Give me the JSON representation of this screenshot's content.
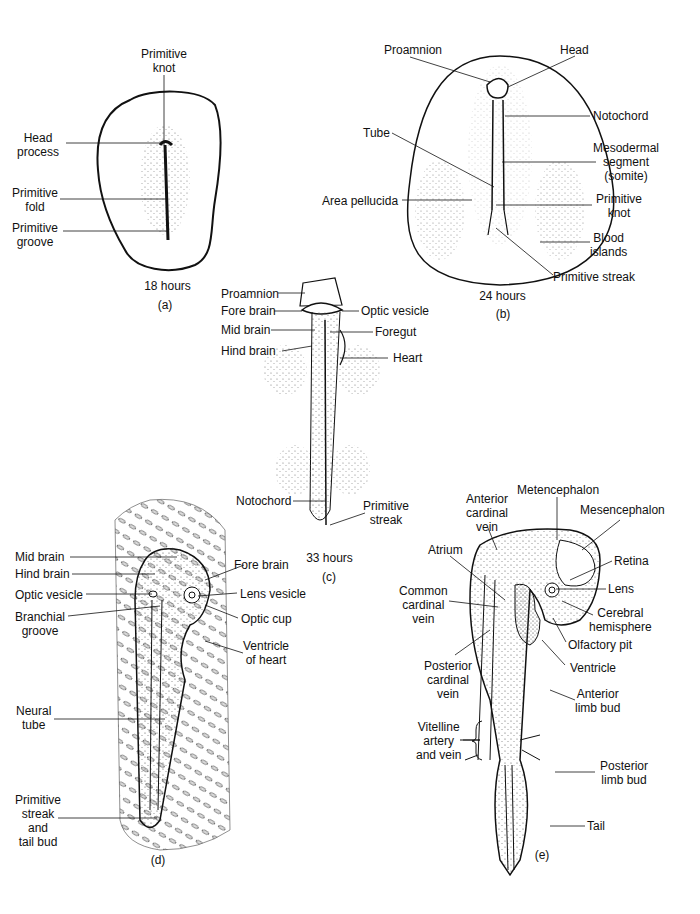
{
  "figure": {
    "panels": [
      {
        "id": "a",
        "caption": "(a)",
        "stage": "18 hours",
        "labels": [
          {
            "text": "Primitive knot",
            "lines": [
              "Primitive",
              "knot"
            ]
          },
          {
            "text": "Head process",
            "lines": [
              "Head",
              "process"
            ]
          },
          {
            "text": "Primitive fold",
            "lines": [
              "Primitive",
              "fold"
            ]
          },
          {
            "text": "Primitive groove",
            "lines": [
              "Primitive",
              "groove"
            ]
          }
        ]
      },
      {
        "id": "b",
        "caption": "(b)",
        "stage": "24 hours",
        "labels": [
          {
            "text": "Proamnion",
            "lines": [
              "Proamnion"
            ]
          },
          {
            "text": "Head",
            "lines": [
              "Head"
            ]
          },
          {
            "text": "Notochord",
            "lines": [
              "Notochord"
            ]
          },
          {
            "text": "Tube",
            "lines": [
              "Tube"
            ]
          },
          {
            "text": "Mesodermal segment (somite)",
            "lines": [
              "Mesodermal",
              "segment",
              "(somite)"
            ]
          },
          {
            "text": "Area pellucida",
            "lines": [
              "Area pellucida"
            ]
          },
          {
            "text": "Primitive knot",
            "lines": [
              "Primitive",
              "knot"
            ]
          },
          {
            "text": "Blood islands",
            "lines": [
              "Blood",
              "islands"
            ]
          },
          {
            "text": "Primitive streak",
            "lines": [
              "Primitive streak"
            ]
          }
        ]
      },
      {
        "id": "c",
        "caption": "(c)",
        "stage": "33 hours",
        "labels": [
          {
            "text": "Proamnion",
            "lines": [
              "Proamnion"
            ]
          },
          {
            "text": "Fore brain",
            "lines": [
              "Fore brain"
            ]
          },
          {
            "text": "Optic vesicle",
            "lines": [
              "Optic vesicle"
            ]
          },
          {
            "text": "Mid brain",
            "lines": [
              "Mid brain"
            ]
          },
          {
            "text": "Foregut",
            "lines": [
              "Foregut"
            ]
          },
          {
            "text": "Hind brain",
            "lines": [
              "Hind brain"
            ]
          },
          {
            "text": "Heart",
            "lines": [
              "Heart"
            ]
          },
          {
            "text": "Notochord",
            "lines": [
              "Notochord"
            ]
          },
          {
            "text": "Primitive streak",
            "lines": [
              "Primitive",
              "streak"
            ]
          }
        ]
      },
      {
        "id": "d",
        "caption": "(d)",
        "labels": [
          {
            "text": "Mid brain",
            "lines": [
              "Mid brain"
            ]
          },
          {
            "text": "Hind brain",
            "lines": [
              "Hind brain"
            ]
          },
          {
            "text": "Fore brain",
            "lines": [
              "Fore brain"
            ]
          },
          {
            "text": "Optic vesicle",
            "lines": [
              "Optic vesicle"
            ]
          },
          {
            "text": "Lens vesicle",
            "lines": [
              "Lens vesicle"
            ]
          },
          {
            "text": "Branchial groove",
            "lines": [
              "Branchial",
              "groove"
            ]
          },
          {
            "text": "Optic cup",
            "lines": [
              "Optic cup"
            ]
          },
          {
            "text": "Ventricle of heart",
            "lines": [
              "Ventricle",
              "of heart"
            ]
          },
          {
            "text": "Neural tube",
            "lines": [
              "Neural",
              "tube"
            ]
          },
          {
            "text": "Primitive streak and tail bud",
            "lines": [
              "Primitive",
              "streak",
              "and",
              "tail bud"
            ]
          }
        ]
      },
      {
        "id": "e",
        "caption": "(e)",
        "labels": [
          {
            "text": "Metencephalon",
            "lines": [
              "Metencephalon"
            ]
          },
          {
            "text": "Anterior cardinal vein",
            "lines": [
              "Anterior",
              "cardinal",
              "vein"
            ]
          },
          {
            "text": "Mesencephalon",
            "lines": [
              "Mesencephalon"
            ]
          },
          {
            "text": "Atrium",
            "lines": [
              "Atrium"
            ]
          },
          {
            "text": "Retina",
            "lines": [
              "Retina"
            ]
          },
          {
            "text": "Common cardinal vein",
            "lines": [
              "Common",
              "cardinal",
              "vein"
            ]
          },
          {
            "text": "Lens",
            "lines": [
              "Lens"
            ]
          },
          {
            "text": "Cerebral hemisphere",
            "lines": [
              "Cerebral",
              "hemisphere"
            ]
          },
          {
            "text": "Olfactory pit",
            "lines": [
              "Olfactory pit"
            ]
          },
          {
            "text": "Posterior cardinal vein",
            "lines": [
              "Posterior",
              "cardinal",
              "vein"
            ]
          },
          {
            "text": "Ventricle",
            "lines": [
              "Ventricle"
            ]
          },
          {
            "text": "Anterior limb bud",
            "lines": [
              "Anterior",
              "limb bud"
            ]
          },
          {
            "text": "Vitelline artery and vein",
            "lines": [
              "Vitelline",
              "artery",
              "and vein"
            ]
          },
          {
            "text": "Posterior limb bud",
            "lines": [
              "Posterior",
              "limb bud"
            ]
          },
          {
            "text": "Tail",
            "lines": [
              "Tail"
            ]
          }
        ]
      }
    ]
  }
}
